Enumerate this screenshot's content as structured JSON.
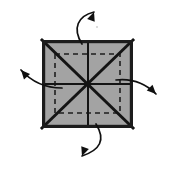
{
  "figure": {
    "canvas": {
      "width": 173,
      "height": 170,
      "background": "#ffffff"
    }
  },
  "sheet": {
    "name": "square-sheet",
    "fill_color": "#a3a3a3",
    "border_color": "#1c1c1c",
    "border_width": 3.2,
    "left": 42,
    "top": 40,
    "right": 133,
    "bottom": 128,
    "center_x": 88,
    "center_y": 84
  },
  "creases": {
    "mountain_color": "#141414",
    "valley_color": "#1e1e1e",
    "mountain_width": 3.0,
    "midline_width": 2.0,
    "valley_dash": "5,4",
    "valley_width": 1.6,
    "diagonals": [
      {
        "name": "crease-diagonal-tl-br",
        "x1": 42,
        "y1": 40,
        "x2": 133,
        "y2": 128
      },
      {
        "name": "crease-diagonal-tr-bl",
        "x1": 133,
        "y1": 40,
        "x2": 42,
        "y2": 128
      }
    ],
    "midlines": [
      {
        "name": "crease-vertical-midline",
        "x1": 88,
        "y1": 40,
        "x2": 88,
        "y2": 128
      },
      {
        "name": "crease-horizontal-midline",
        "x1": 42,
        "y1": 84,
        "x2": 133,
        "y2": 84
      }
    ],
    "inner_square": {
      "name": "crease-inner-square",
      "left": 55,
      "top": 54,
      "right": 120,
      "bottom": 113
    }
  },
  "arrows": {
    "color": "#101010",
    "stroke_width": 1.7,
    "head_length": 9,
    "items": [
      {
        "name": "arrow-up-right",
        "direction": "up-right",
        "path": "M 82,44 C 72,28 78,16 94,12",
        "tip_x": 94,
        "tip_y": 12,
        "head_angle": -70
      },
      {
        "name": "arrow-up-left",
        "direction": "up-left",
        "path": "M 62,88 C 44,88 30,80 21,70",
        "tip_x": 21,
        "tip_y": 70,
        "head_angle": -132
      },
      {
        "name": "arrow-down-right",
        "direction": "down-right",
        "path": "M 116,80 C 134,78 146,84 156,94",
        "tip_x": 156,
        "tip_y": 94,
        "head_angle": 45
      },
      {
        "name": "arrow-down-left",
        "direction": "down-left",
        "path": "M 96,124 C 106,140 100,150 82,156",
        "tip_x": 82,
        "tip_y": 156,
        "head_angle": 110
      }
    ]
  },
  "marks": [
    {
      "name": "speck-mark",
      "x": 96,
      "y": 26
    }
  ]
}
